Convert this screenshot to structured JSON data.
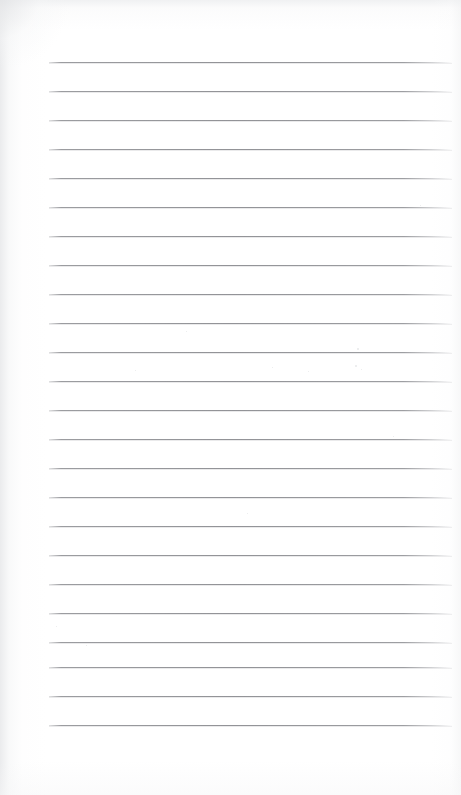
{
  "document": {
    "kind": "scanned-blank-lined-notepad-page",
    "title": "Blank Lined Notepad Page",
    "orientation": "portrait",
    "page_width_px": 461,
    "page_height_px": 795,
    "paper_color": "#ffffff",
    "has_text": false,
    "has_handwriting": false,
    "has_header": false,
    "has_footer": false,
    "has_page_number": false,
    "has_margin_rule": false,
    "has_holes": false
  },
  "ruling": {
    "style": "horizontal-ruled",
    "line_color": "#929397",
    "line_thickness_px": 1,
    "line_count": 24,
    "spacing_px": 29,
    "first_line_y_px": 62,
    "last_line_y_px": 725,
    "line_start_x_px": 49,
    "line_end_x_px": 452,
    "line_length_px": 403,
    "top_margin_px": 62,
    "bottom_margin_px": 70,
    "left_margin_px": 49,
    "right_margin_px": 9,
    "line_y_positions": [
      62,
      91,
      120,
      149,
      178,
      207,
      236,
      265,
      294,
      323,
      352,
      381,
      410,
      439,
      468,
      497,
      526,
      555,
      584,
      613,
      642,
      667,
      696,
      725
    ]
  },
  "content": {
    "lines": [
      {
        "index": 1,
        "text": ""
      },
      {
        "index": 2,
        "text": ""
      },
      {
        "index": 3,
        "text": ""
      },
      {
        "index": 4,
        "text": ""
      },
      {
        "index": 5,
        "text": ""
      },
      {
        "index": 6,
        "text": ""
      },
      {
        "index": 7,
        "text": ""
      },
      {
        "index": 8,
        "text": ""
      },
      {
        "index": 9,
        "text": ""
      },
      {
        "index": 10,
        "text": ""
      },
      {
        "index": 11,
        "text": ""
      },
      {
        "index": 12,
        "text": ""
      },
      {
        "index": 13,
        "text": ""
      },
      {
        "index": 14,
        "text": ""
      },
      {
        "index": 15,
        "text": ""
      },
      {
        "index": 16,
        "text": ""
      },
      {
        "index": 17,
        "text": ""
      },
      {
        "index": 18,
        "text": ""
      },
      {
        "index": 19,
        "text": ""
      },
      {
        "index": 20,
        "text": ""
      },
      {
        "index": 21,
        "text": ""
      },
      {
        "index": 22,
        "text": ""
      },
      {
        "index": 23,
        "text": ""
      },
      {
        "index": 24,
        "text": ""
      }
    ]
  },
  "scan_artifacts": {
    "edge_shading": true,
    "edge_shading_sides": [
      "left",
      "top",
      "right",
      "bottom"
    ],
    "vignette_corner": "top-left",
    "specks": [
      {
        "x": 357,
        "y": 348,
        "size": 2
      },
      {
        "x": 361,
        "y": 369,
        "size": 1
      },
      {
        "x": 308,
        "y": 371,
        "size": 1
      },
      {
        "x": 272,
        "y": 367,
        "size": 1
      },
      {
        "x": 135,
        "y": 370,
        "size": 1
      },
      {
        "x": 186,
        "y": 331,
        "size": 1
      },
      {
        "x": 355,
        "y": 365,
        "size": 2
      },
      {
        "x": 247,
        "y": 513,
        "size": 1
      },
      {
        "x": 86,
        "y": 645,
        "size": 1
      },
      {
        "x": 420,
        "y": 205,
        "size": 1
      },
      {
        "x": 56,
        "y": 626,
        "size": 1
      },
      {
        "x": 393,
        "y": 436,
        "size": 1
      }
    ]
  }
}
